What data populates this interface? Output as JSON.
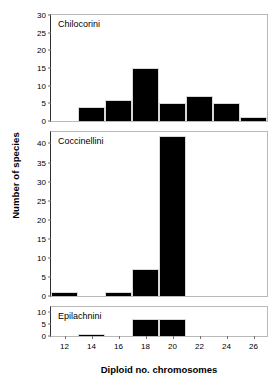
{
  "chart_data": {
    "type": "bar",
    "title": "",
    "xlabel": "Diploid no. chromosomes",
    "ylabel": "Number of species",
    "xlim": [
      11,
      27
    ],
    "xticks": [
      12,
      14,
      16,
      18,
      20,
      22,
      24,
      26
    ],
    "grid": false,
    "legend": "none",
    "bar_color": "#000000",
    "panels": [
      {
        "name": "panel-chilocorini",
        "title": "Chilocorini",
        "ylim": [
          0,
          30
        ],
        "yticks": [
          0,
          5,
          10,
          15,
          20,
          25,
          30
        ],
        "categories": [
          12,
          14,
          16,
          18,
          20,
          22,
          24,
          26
        ],
        "values": [
          0,
          4,
          6,
          15,
          5,
          7,
          5,
          1
        ]
      },
      {
        "name": "panel-coccinellini",
        "title": "Coccinellini",
        "ylim": [
          0,
          43
        ],
        "yticks": [
          0,
          5,
          10,
          15,
          20,
          25,
          30,
          35,
          40
        ],
        "categories": [
          12,
          14,
          16,
          18,
          20,
          22,
          24,
          26
        ],
        "values": [
          1,
          0,
          1,
          7,
          42,
          0,
          0,
          0
        ]
      },
      {
        "name": "panel-epilachnini",
        "title": "Epilachnini",
        "ylim": [
          0,
          12
        ],
        "yticks": [
          0,
          5,
          10
        ],
        "categories": [
          12,
          14,
          16,
          18,
          20,
          22,
          24,
          26
        ],
        "values": [
          0,
          1,
          0,
          7,
          7,
          0,
          0,
          0
        ]
      }
    ]
  }
}
